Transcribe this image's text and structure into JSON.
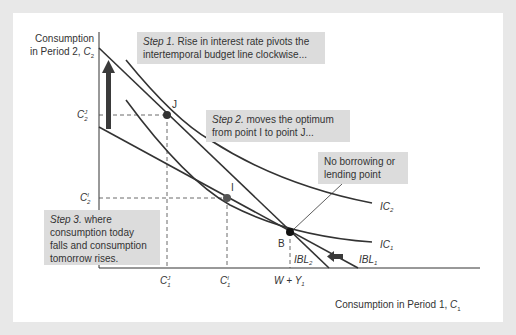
{
  "diagram": {
    "type": "intertemporal-choice",
    "y_axis_label": "Consumption in Period 2, C2",
    "y_axis_label_line1": "Consumption",
    "y_axis_label_line2_prefix": "in Period 2, ",
    "y_axis_label_var": "C",
    "y_axis_label_sub": "2",
    "x_axis_label_prefix": "Consumption in Period 1, ",
    "x_axis_label_var": "C",
    "x_axis_label_sub": "1",
    "notes": {
      "step1": {
        "lead": "Step 1.",
        "text": " Rise in interest rate pivots the intertemporal budget line clockwise..."
      },
      "step2": {
        "lead": "Step 2.",
        "text": " moves the optimum from point I to point J..."
      },
      "step3": {
        "lead": "Step 3.",
        "text": " where consumption today falls and consumption tomorrow rises."
      },
      "no_borrowing": "No borrowing or lending point"
    },
    "points": {
      "J": {
        "label": "J"
      },
      "I": {
        "label": "I"
      },
      "B": {
        "label": "B"
      }
    },
    "curve_labels": {
      "IC2": {
        "base": "IC",
        "sub": "2"
      },
      "IC1": {
        "base": "IC",
        "sub": "1"
      },
      "IBL2": {
        "base": "IBL",
        "sub": "2"
      },
      "IBL1": {
        "base": "IBL",
        "sub": "1"
      }
    },
    "tick_labels": {
      "C2J": {
        "base": "C",
        "sup": "J",
        "sub": "2"
      },
      "C2I": {
        "base": "C",
        "sup": "I",
        "sub": "2"
      },
      "C1J": {
        "base": "C",
        "sup": "J",
        "sub": "1"
      },
      "C1I": {
        "base": "C",
        "sup": "I",
        "sub": "1"
      },
      "WY1": {
        "text": "W + Y",
        "sub": "1"
      }
    },
    "colors": {
      "background": "#e8e8e8",
      "panel": "#ffffff",
      "note_fill": "#dcdcdc",
      "line": "#333333",
      "arrow": "#3a3a3a"
    }
  }
}
